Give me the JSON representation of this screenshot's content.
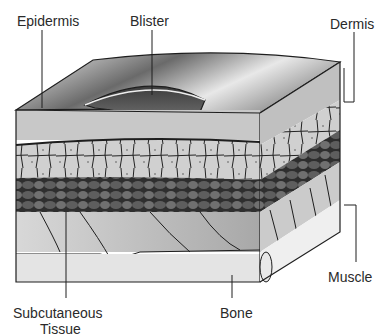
{
  "diagram": {
    "type": "skin cross-section with blister",
    "labels": {
      "epidermis": "Epidermis",
      "blister": "Blister",
      "dermis": "Dermis",
      "muscle": "Muscle",
      "bone": "Bone",
      "subcutaneous_line1": "Subcutaneous",
      "subcutaneous_line2": "Tissue"
    },
    "colors": {
      "outline": "#1e1e1e",
      "top_surface_light": "#f2f2f2",
      "top_surface_dark": "#4a4a4a",
      "blister_fill": "#5a5a5a",
      "epidermis_band": "#c8c8c8",
      "dermis_cells": "#cfcfcf",
      "fat_cells": "#4e4e4e",
      "muscle": "#bdbdbd",
      "bone": "#e4e4e4",
      "label_text": "#2a2a2a"
    }
  }
}
